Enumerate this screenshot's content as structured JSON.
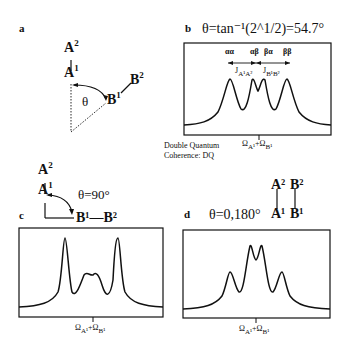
{
  "panels": {
    "a": {
      "label": "a",
      "atoms": {
        "A2": "A",
        "A2_sup": "2",
        "A1": "A",
        "A1_sup": "1",
        "B1": "B",
        "B1_sup": "1",
        "B2": "B",
        "B2_sup": "2"
      },
      "angle_label": "θ"
    },
    "b": {
      "label": "b",
      "title": "θ=tan⁻¹(2^1/2)=54.7°",
      "peak_labels": [
        "αα",
        "αβ",
        "βα",
        "ββ"
      ],
      "j_labels": [
        "J",
        "A¹A²",
        "J",
        "B¹B²"
      ],
      "x_label_main": "Ω",
      "x_label_sub1": "A¹",
      "x_label_plus": "+Ω",
      "x_label_sub2": "B¹",
      "caption_line1": "Double Quantum",
      "caption_line2": "Coherence: DQ"
    },
    "c": {
      "label": "c",
      "title": "θ=90°",
      "atoms": {
        "A2": "A",
        "A2_sup": "2",
        "A1": "A",
        "A1_sup": "1",
        "B": "B¹—B²"
      },
      "x_label_main": "Ω",
      "x_label_sub1": "A¹",
      "x_label_plus": "+Ω",
      "x_label_sub2": "B¹"
    },
    "d": {
      "label": "d",
      "title": "θ=0,180°",
      "atoms": {
        "A2": "A²",
        "A1": "A¹",
        "B2": "B²",
        "B1": "B¹"
      },
      "x_label_main": "Ω",
      "x_label_sub1": "A¹",
      "x_label_plus": "+Ω",
      "x_label_sub2": "B¹"
    }
  }
}
